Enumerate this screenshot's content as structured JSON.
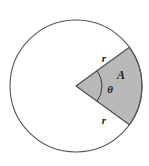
{
  "figure": {
    "name": "circle-sector-area-diagram",
    "background_color": "#ffffff",
    "circle": {
      "center_x": 76,
      "center_y": 86,
      "radius": 66,
      "stroke_color": "#54545a",
      "stroke_width": 1.1,
      "fill": "none"
    },
    "sector": {
      "fill_color": "#b9b9b9",
      "stroke_color": "#4a4a4f",
      "stroke_width": 1.1,
      "start_angle_deg": -36,
      "end_angle_deg": 36,
      "apex_x": 76,
      "apex_y": 86
    },
    "angle_arc": {
      "radius": 26,
      "stroke_color": "#3a3a3f",
      "stroke_width": 1.0
    },
    "labels": [
      {
        "id": "radius-upper",
        "text": "r",
        "x": 104,
        "y": 62
      },
      {
        "id": "area",
        "text": "A",
        "x": 121,
        "y": 79
      },
      {
        "id": "angle-theta",
        "text": "θ",
        "x": 110,
        "y": 93
      },
      {
        "id": "radius-lower",
        "text": "r",
        "x": 104,
        "y": 124
      }
    ]
  }
}
